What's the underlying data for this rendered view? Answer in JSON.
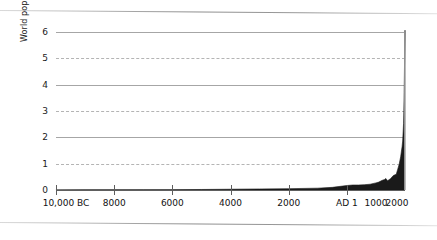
{
  "chart_data": {
    "type": "area",
    "title": "",
    "subtitle": "",
    "xlabel": "",
    "ylabel": "World population, billions",
    "ylim": [
      0,
      6
    ],
    "xlim": [
      -10000,
      2000
    ],
    "grid": "horizontal",
    "legend": "none",
    "y_ticks": [
      {
        "value": 6,
        "label": "6",
        "style": "solid"
      },
      {
        "value": 5,
        "label": "5",
        "style": "dashed"
      },
      {
        "value": 4,
        "label": "4",
        "style": "solid"
      },
      {
        "value": 3,
        "label": "3",
        "style": "dashed"
      },
      {
        "value": 2,
        "label": "2",
        "style": "solid"
      },
      {
        "value": 1,
        "label": "1",
        "style": "dashed"
      },
      {
        "value": 0,
        "label": "0",
        "style": "axis"
      }
    ],
    "x_ticks": [
      {
        "value": -10000,
        "label": "10,000 BC",
        "tick": true
      },
      {
        "value": -8000,
        "label": "8000",
        "tick": true
      },
      {
        "value": -6000,
        "label": "6000",
        "tick": true
      },
      {
        "value": -4000,
        "label": "4000",
        "tick": true
      },
      {
        "value": -2000,
        "label": "2000",
        "tick": true
      },
      {
        "value": 1,
        "label": "AD 1",
        "tick": true
      },
      {
        "value": 1000,
        "label": "1000",
        "tick": false
      },
      {
        "value": 2000,
        "label": "2000",
        "tick": false
      }
    ],
    "series": [
      {
        "name": "World population",
        "color": "#1a1a1a",
        "x": [
          -10000,
          -9000,
          -8000,
          -7000,
          -6000,
          -5000,
          -4000,
          -3000,
          -2000,
          -1000,
          -500,
          1,
          200,
          400,
          600,
          800,
          1000,
          1100,
          1200,
          1300,
          1340,
          1400,
          1500,
          1600,
          1700,
          1750,
          1800,
          1850,
          1900,
          1920,
          1940,
          1950,
          1960,
          1970,
          1980,
          1990,
          2000
        ],
        "values": [
          0.004,
          0.005,
          0.007,
          0.01,
          0.013,
          0.02,
          0.03,
          0.04,
          0.05,
          0.07,
          0.1,
          0.17,
          0.19,
          0.19,
          0.2,
          0.22,
          0.27,
          0.3,
          0.36,
          0.4,
          0.44,
          0.35,
          0.43,
          0.55,
          0.6,
          0.79,
          0.98,
          1.26,
          1.65,
          1.86,
          2.3,
          2.52,
          3.02,
          3.7,
          4.44,
          5.27,
          6.07
        ]
      }
    ]
  },
  "axis": {
    "y_title": "World population, billions"
  }
}
